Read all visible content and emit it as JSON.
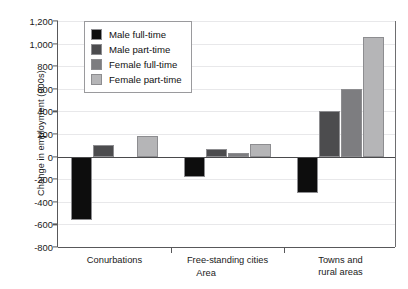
{
  "chart_data": {
    "type": "bar",
    "title": "",
    "xlabel": "Area",
    "ylabel": "Change in employment (000s)",
    "ylim": [
      -800,
      1200
    ],
    "ytick_step": 200,
    "ytick_labels": [
      "1,200",
      "1,000",
      "800",
      "600",
      "400",
      "200",
      "0",
      "-200",
      "-400",
      "-600",
      "-800"
    ],
    "ytick_values": [
      1200,
      1000,
      800,
      600,
      400,
      200,
      0,
      -200,
      -400,
      -600,
      -800
    ],
    "grid": true,
    "legend_position": "top-left-inside",
    "categories": [
      "Conurbations",
      "Free-standing cities",
      "Towns and\nrural areas"
    ],
    "series": [
      {
        "name": "Male full-time",
        "color": "#0d0d0d",
        "values": [
          -560,
          -180,
          -320
        ]
      },
      {
        "name": "Male part-time",
        "color": "#4c4c4e",
        "values": [
          100,
          70,
          400
        ]
      },
      {
        "name": "Female full-time",
        "color": "#7d7d80",
        "values": [
          0,
          35,
          600
        ]
      },
      {
        "name": "Female part-time",
        "color": "#b5b5b7",
        "values": [
          180,
          110,
          1060
        ]
      }
    ]
  },
  "legend": {
    "items": [
      {
        "label": "Male full-time"
      },
      {
        "label": "Male part-time"
      },
      {
        "label": "Female full-time"
      },
      {
        "label": "Female part-time"
      }
    ]
  }
}
